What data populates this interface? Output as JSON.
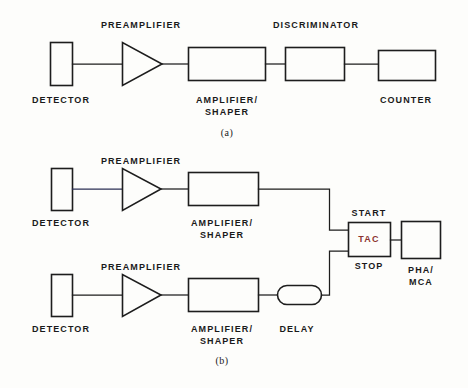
{
  "figure": {
    "title_a": "(a)",
    "title_b": "(b)",
    "accent_color": "#8c3330",
    "line_color": "#1d1d1d",
    "background": "#fdfdfb"
  },
  "diagram_a": {
    "caption": "(a)",
    "labels": {
      "detector": "DETECTOR",
      "preamplifier": "PREAMPLIFIER",
      "amplifier_shaper_line1": "AMPLIFIER/",
      "amplifier_shaper_line2": "SHAPER",
      "discriminator": "DISCRIMINATOR",
      "counter": "COUNTER"
    },
    "blocks": [
      {
        "name": "detector",
        "shape": "rectangle"
      },
      {
        "name": "preamplifier",
        "shape": "triangle"
      },
      {
        "name": "amplifier-shaper",
        "shape": "rectangle"
      },
      {
        "name": "discriminator",
        "shape": "rectangle"
      },
      {
        "name": "counter",
        "shape": "rectangle"
      }
    ]
  },
  "diagram_b": {
    "caption": "(b)",
    "labels": {
      "detector_top": "DETECTOR",
      "detector_bottom": "DETECTOR",
      "preamplifier_top": "PREAMPLIFIER",
      "preamplifier_bottom": "PREAMPLIFIER",
      "amplifier_shaper_top_line1": "AMPLIFIER/",
      "amplifier_shaper_top_line2": "SHAPER",
      "amplifier_shaper_bottom_line1": "AMPLIFIER/",
      "amplifier_shaper_bottom_line2": "SHAPER",
      "delay": "DELAY",
      "start": "START",
      "stop": "STOP",
      "tac": "TAC",
      "pha_mca_line1": "PHA/",
      "pha_mca_line2": "MCA"
    },
    "blocks": [
      {
        "name": "detector-top",
        "shape": "rectangle"
      },
      {
        "name": "preamplifier-top",
        "shape": "triangle"
      },
      {
        "name": "amplifier-shaper-top",
        "shape": "rectangle"
      },
      {
        "name": "detector-bottom",
        "shape": "rectangle"
      },
      {
        "name": "preamplifier-bottom",
        "shape": "triangle"
      },
      {
        "name": "amplifier-shaper-bottom",
        "shape": "rectangle"
      },
      {
        "name": "delay",
        "shape": "stadium"
      },
      {
        "name": "tac",
        "shape": "rectangle"
      },
      {
        "name": "pha-mca",
        "shape": "rectangle"
      }
    ]
  }
}
